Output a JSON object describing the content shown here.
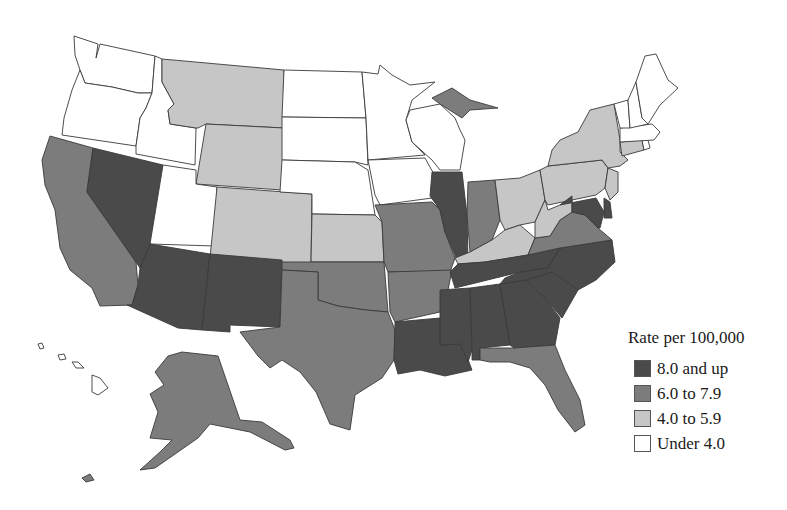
{
  "legend": {
    "title": "Rate per 100,000",
    "items": [
      {
        "key": "c4",
        "label": "8.0 and up",
        "color": "#4a4a4a"
      },
      {
        "key": "c3",
        "label": "6.0 to 7.9",
        "color": "#7c7c7c"
      },
      {
        "key": "c2",
        "label": "4.0 to 5.9",
        "color": "#c6c6c6"
      },
      {
        "key": "c1",
        "label": "Under 4.0",
        "color": "#ffffff"
      }
    ]
  },
  "states": {
    "WA": "c1",
    "OR": "c1",
    "ID": "c1",
    "UT": "c1",
    "ND": "c1",
    "SD": "c1",
    "NE": "c1",
    "MN": "c1",
    "IA": "c1",
    "WI": "c1",
    "ME": "c1",
    "VT": "c1",
    "NH": "c1",
    "MA": "c1",
    "RI": "c1",
    "HI": "c1",
    "MT": "c2",
    "WY": "c2",
    "CO": "c2",
    "KS": "c2",
    "KY": "c2",
    "OH": "c2",
    "WV": "c2",
    "PA": "c2",
    "NY": "c2",
    "NJ": "c2",
    "CT": "c2",
    "CA": "c3",
    "TX": "c3",
    "OK": "c3",
    "MO": "c3",
    "AR": "c3",
    "MI": "c3",
    "IN": "c3",
    "VA": "c3",
    "FL": "c3",
    "AK": "c3",
    "NV": "c4",
    "AZ": "c4",
    "NM": "c4",
    "IL": "c4",
    "LA": "c4",
    "MS": "c4",
    "AL": "c4",
    "TN": "c4",
    "GA": "c4",
    "SC": "c4",
    "NC": "c4",
    "MD": "c4",
    "DE": "c4"
  }
}
